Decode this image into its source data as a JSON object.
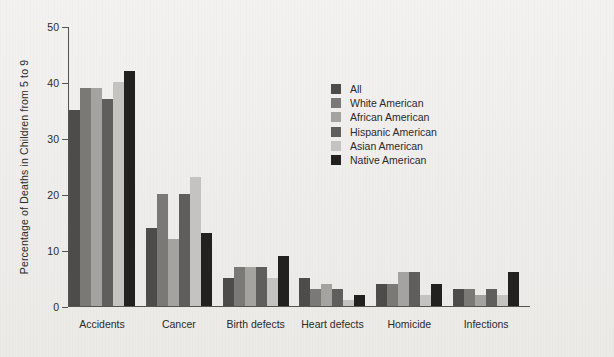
{
  "chart_data": {
    "type": "bar",
    "title": "",
    "subtitle": "",
    "xlabel": "",
    "ylabel": "Percentage of Deaths in Children from 5 to 9",
    "ylim": [
      0,
      50
    ],
    "yticks": [
      0,
      10,
      20,
      30,
      40,
      50
    ],
    "ytick_labels": [
      "0",
      "10",
      "20",
      "30",
      "40",
      "50"
    ],
    "grid": false,
    "legend_position": "inside-upper-right",
    "categories": [
      "Accidents",
      "Cancer",
      "Birth defects",
      "Heart defects",
      "Homicide",
      "Infections"
    ],
    "series": [
      {
        "name": "All",
        "color": "#4e4c4a",
        "values": [
          35,
          14,
          5,
          5,
          4,
          3
        ]
      },
      {
        "name": "White American",
        "color": "#7b7976",
        "values": [
          39,
          20,
          7,
          3,
          4,
          3
        ]
      },
      {
        "name": "African American",
        "color": "#a5a3a0",
        "values": [
          39,
          12,
          7,
          4,
          6,
          2
        ]
      },
      {
        "name": "Hispanic American",
        "color": "#605e5c",
        "values": [
          37,
          20,
          7,
          3,
          6,
          3
        ]
      },
      {
        "name": "Asian American",
        "color": "#c5c3c0",
        "values": [
          40,
          23,
          5,
          1,
          2,
          2
        ]
      },
      {
        "name": "Native American",
        "color": "#23211f",
        "values": [
          42,
          13,
          9,
          2,
          4,
          6
        ]
      }
    ]
  },
  "legend": {
    "items": [
      {
        "label": "All",
        "color": "#4e4c4a"
      },
      {
        "label": "White American",
        "color": "#7b7976"
      },
      {
        "label": "African American",
        "color": "#a5a3a0"
      },
      {
        "label": "Hispanic American",
        "color": "#605e5c"
      },
      {
        "label": "Asian American",
        "color": "#c5c3c0"
      },
      {
        "label": "Native American",
        "color": "#23211f"
      }
    ]
  },
  "axis": {
    "y_title": "Percentage of Deaths in Children from 5 to 9",
    "y_tick_labels": [
      "0",
      "10",
      "20",
      "30",
      "40",
      "50"
    ],
    "x_tick_labels": [
      "Accidents",
      "Cancer",
      "Birth defects",
      "Heart defects",
      "Homicide",
      "Infections"
    ]
  }
}
